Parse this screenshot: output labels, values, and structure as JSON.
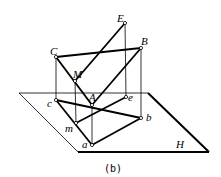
{
  "diagram": {
    "caption": "(b)",
    "plane_label": "H",
    "points": {
      "E": {
        "label": "E",
        "x": 125,
        "y": 23
      },
      "B": {
        "label": "B",
        "x": 141,
        "y": 48
      },
      "C": {
        "label": "C",
        "x": 56,
        "y": 57
      },
      "M": {
        "label": "M",
        "x": 75,
        "y": 81
      },
      "A": {
        "label": "A",
        "x": 92,
        "y": 105
      },
      "e": {
        "label": "e",
        "x": 126,
        "y": 97
      },
      "c": {
        "label": "c",
        "x": 56,
        "y": 100
      },
      "m": {
        "label": "m",
        "x": 76,
        "y": 123
      },
      "b": {
        "label": "b",
        "x": 141,
        "y": 118
      },
      "a": {
        "label": "a",
        "x": 92,
        "y": 145
      }
    },
    "plane": {
      "tl": [
        19,
        93
      ],
      "tr": [
        148,
        93
      ],
      "br": [
        209,
        152
      ],
      "bl": [
        78,
        152
      ]
    },
    "colors": {
      "line": "#000000",
      "background": "#ffffff"
    }
  }
}
